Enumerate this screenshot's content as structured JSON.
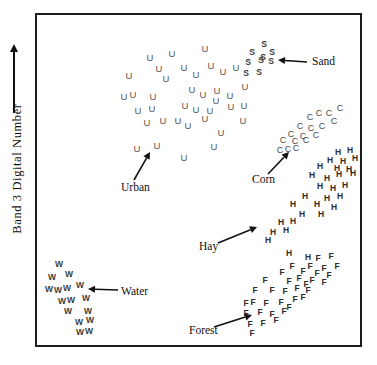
{
  "figure": {
    "width": 377,
    "height": 365,
    "background": "#ffffff",
    "frame_color": "#1b1b1b"
  },
  "axes": {
    "y_label": "Band 3 Digital Number",
    "y_arrow": "up-arrow",
    "x_label": "",
    "grid": false
  },
  "annotations": [
    {
      "name": "sand",
      "label": "Sand",
      "label_x": 312,
      "label_y": 62,
      "arrow_from_x": 307,
      "arrow_from_y": 62,
      "arrow_to_x": 278,
      "arrow_to_y": 60
    },
    {
      "name": "corn",
      "label": "Corn",
      "label_x": 252,
      "label_y": 180,
      "arrow_from_x": 268,
      "arrow_from_y": 174,
      "arrow_to_x": 289,
      "arrow_to_y": 152
    },
    {
      "name": "urban",
      "label": "Urban",
      "label_x": 121,
      "label_y": 188,
      "arrow_from_x": 134,
      "arrow_from_y": 180,
      "arrow_to_x": 150,
      "arrow_to_y": 152
    },
    {
      "name": "hay",
      "label": "Hay",
      "label_x": 199,
      "label_y": 247,
      "arrow_from_x": 218,
      "arrow_from_y": 243,
      "arrow_to_x": 257,
      "arrow_to_y": 227
    },
    {
      "name": "water",
      "label": "Water",
      "label_x": 121,
      "label_y": 292,
      "arrow_from_x": 118,
      "arrow_from_y": 290,
      "arrow_to_x": 88,
      "arrow_to_y": 289
    },
    {
      "name": "forest",
      "label": "Forest",
      "label_x": 189,
      "label_y": 331,
      "arrow_from_x": 214,
      "arrow_from_y": 327,
      "arrow_to_x": 252,
      "arrow_to_y": 315
    }
  ],
  "chart_data": {
    "type": "scatter",
    "title": "",
    "xlabel": "",
    "ylabel": "Band 3 Digital Number",
    "xlim": [
      35,
      362
    ],
    "ylim": [
      13,
      347
    ],
    "grid": false,
    "legend": "inline-annotations",
    "note": "Classic remote-sensing spectral feature-space plot; each class plotted with its initial letter as the marker glyph.",
    "series": [
      {
        "name": "Urban",
        "marker": "U",
        "color": "#555555",
        "count": 38,
        "points": [
          [
            205,
            48
          ],
          [
            150,
            57
          ],
          [
            172,
            53
          ],
          [
            211,
            65
          ],
          [
            184,
            67
          ],
          [
            159,
            68
          ],
          [
            129,
            75
          ],
          [
            166,
            78
          ],
          [
            236,
            67
          ],
          [
            196,
            74
          ],
          [
            223,
            71
          ],
          [
            245,
            86
          ],
          [
            192,
            89
          ],
          [
            217,
            90
          ],
          [
            133,
            94
          ],
          [
            124,
            96
          ],
          [
            153,
            96
          ],
          [
            203,
            94
          ],
          [
            216,
            100
          ],
          [
            230,
            95
          ],
          [
            138,
            110
          ],
          [
            152,
            108
          ],
          [
            185,
            105
          ],
          [
            196,
            109
          ],
          [
            231,
            106
          ],
          [
            210,
            110
          ],
          [
            244,
            105
          ],
          [
            178,
            120
          ],
          [
            205,
            118
          ],
          [
            243,
            120
          ],
          [
            147,
            122
          ],
          [
            163,
            120
          ],
          [
            188,
            125
          ],
          [
            221,
            132
          ],
          [
            137,
            148
          ],
          [
            157,
            145
          ],
          [
            214,
            146
          ],
          [
            184,
            157
          ]
        ]
      },
      {
        "name": "Sand",
        "marker": "S",
        "color": "#3a3a3a",
        "count": 9,
        "points": [
          [
            264,
            44
          ],
          [
            252,
            52
          ],
          [
            272,
            52
          ],
          [
            248,
            62
          ],
          [
            261,
            60
          ],
          [
            271,
            61
          ],
          [
            246,
            73
          ],
          [
            259,
            72
          ],
          [
            263,
            57
          ]
        ]
      },
      {
        "name": "Corn",
        "marker": "C",
        "color": "#4a4a4a",
        "count": 17,
        "points": [
          [
            340,
            108
          ],
          [
            319,
            113
          ],
          [
            329,
            113
          ],
          [
            310,
            117
          ],
          [
            334,
            121
          ],
          [
            300,
            126
          ],
          [
            311,
            128
          ],
          [
            322,
            126
          ],
          [
            291,
            134
          ],
          [
            303,
            136
          ],
          [
            316,
            135
          ],
          [
            283,
            140
          ],
          [
            295,
            141
          ],
          [
            306,
            140
          ],
          [
            280,
            150
          ],
          [
            288,
            149
          ],
          [
            296,
            148
          ]
        ]
      },
      {
        "name": "Hay",
        "marker": "H",
        "color": "#2e2e2e",
        "count": 28,
        "points": [
          [
            338,
            152
          ],
          [
            350,
            150
          ],
          [
            330,
            160
          ],
          [
            343,
            161
          ],
          [
            355,
            158
          ],
          [
            320,
            166
          ],
          [
            337,
            168
          ],
          [
            349,
            169
          ],
          [
            312,
            175
          ],
          [
            327,
            178
          ],
          [
            339,
            174
          ],
          [
            353,
            173
          ],
          [
            320,
            186
          ],
          [
            333,
            188
          ],
          [
            345,
            185
          ],
          [
            305,
            196
          ],
          [
            327,
            198
          ],
          [
            340,
            196
          ],
          [
            293,
            204
          ],
          [
            317,
            204
          ],
          [
            334,
            207
          ],
          [
            302,
            214
          ],
          [
            321,
            214
          ],
          [
            281,
            222
          ],
          [
            293,
            221
          ],
          [
            273,
            232
          ],
          [
            286,
            230
          ],
          [
            268,
            240
          ],
          [
            289,
            253
          ],
          [
            308,
            257
          ]
        ]
      },
      {
        "name": "Forest",
        "marker": "F",
        "color": "#2e2e2e",
        "count": 36,
        "points": [
          [
            318,
            258
          ],
          [
            331,
            256
          ],
          [
            292,
            266
          ],
          [
            310,
            266
          ],
          [
            324,
            268
          ],
          [
            337,
            266
          ],
          [
            282,
            272
          ],
          [
            303,
            271
          ],
          [
            317,
            273
          ],
          [
            329,
            275
          ],
          [
            265,
            280
          ],
          [
            289,
            281
          ],
          [
            299,
            278
          ],
          [
            312,
            280
          ],
          [
            324,
            282
          ],
          [
            255,
            290
          ],
          [
            272,
            290
          ],
          [
            285,
            291
          ],
          [
            297,
            288
          ],
          [
            308,
            290
          ],
          [
            246,
            303
          ],
          [
            253,
            302
          ],
          [
            266,
            303
          ],
          [
            281,
            302
          ],
          [
            295,
            299
          ],
          [
            303,
            297
          ],
          [
            246,
            313
          ],
          [
            260,
            312
          ],
          [
            272,
            314
          ],
          [
            284,
            311
          ],
          [
            250,
            324
          ],
          [
            263,
            323
          ],
          [
            276,
            320
          ],
          [
            252,
            333
          ],
          [
            289,
            307
          ],
          [
            306,
            284
          ]
        ]
      },
      {
        "name": "Water",
        "marker": "W",
        "color": "#3a3a3a",
        "count": 16,
        "points": [
          [
            59,
            264
          ],
          [
            52,
            277
          ],
          [
            69,
            274
          ],
          [
            49,
            289
          ],
          [
            67,
            288
          ],
          [
            80,
            285
          ],
          [
            71,
            300
          ],
          [
            86,
            298
          ],
          [
            68,
            311
          ],
          [
            88,
            311
          ],
          [
            79,
            322
          ],
          [
            90,
            320
          ],
          [
            80,
            332
          ],
          [
            89,
            331
          ],
          [
            62,
            301
          ],
          [
            58,
            290
          ]
        ]
      }
    ]
  }
}
